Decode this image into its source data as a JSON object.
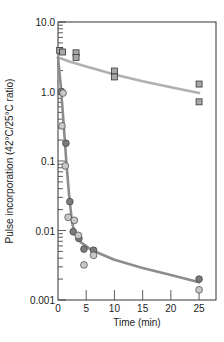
{
  "chart_data": {
    "type": "scatter",
    "title": "",
    "xlabel": "Time (min)",
    "ylabel": "Pulse incorporation (42°C/25°C ratio)",
    "xlim": [
      0,
      28
    ],
    "ylim": [
      0.001,
      10.0
    ],
    "yscale": "log",
    "grid": false,
    "legend": null,
    "x_ticks": [
      0,
      5,
      10,
      15,
      20,
      25
    ],
    "x_tick_labels": [
      "0",
      "5",
      "10",
      "15",
      "20",
      "25"
    ],
    "y_ticks": [
      10.0,
      1.0,
      0.1,
      0.01,
      0.001
    ],
    "y_tick_labels": [
      "10.0",
      "1.0",
      "0.1",
      "0.01",
      "0.001"
    ],
    "series": [
      {
        "name": "squares",
        "marker": "square",
        "color": "#a8a8a8",
        "points": [
          {
            "x": 0.3,
            "y": 3.9
          },
          {
            "x": 0.8,
            "y": 3.7
          },
          {
            "x": 3.2,
            "y": 3.6
          },
          {
            "x": 3.2,
            "y": 3.1
          },
          {
            "x": 10,
            "y": 1.97
          },
          {
            "x": 10,
            "y": 1.62
          },
          {
            "x": 25,
            "y": 1.28
          },
          {
            "x": 25,
            "y": 0.71
          }
        ]
      },
      {
        "name": "dark-circles",
        "marker": "circle",
        "color": "#7a7a7a",
        "points": [
          {
            "x": 0.6,
            "y": 1.0
          },
          {
            "x": 1.4,
            "y": 0.18
          },
          {
            "x": 2.1,
            "y": 0.026
          },
          {
            "x": 2.7,
            "y": 0.0096
          },
          {
            "x": 3.7,
            "y": 0.0077
          },
          {
            "x": 4.6,
            "y": 0.0054
          },
          {
            "x": 6.3,
            "y": 0.0052
          },
          {
            "x": 25,
            "y": 0.002
          }
        ]
      },
      {
        "name": "light-circles",
        "marker": "circle",
        "color": "#c8c8c8",
        "points": [
          {
            "x": 0.9,
            "y": 0.95
          },
          {
            "x": 0.7,
            "y": 0.32
          },
          {
            "x": 1.3,
            "y": 0.085
          },
          {
            "x": 1.8,
            "y": 0.0155
          },
          {
            "x": 2.9,
            "y": 0.014
          },
          {
            "x": 3.6,
            "y": 0.0085
          },
          {
            "x": 6.3,
            "y": 0.0044
          },
          {
            "x": 4.6,
            "y": 0.0032
          },
          {
            "x": 25,
            "y": 0.0014
          }
        ]
      }
    ],
    "fit_curves": [
      {
        "name": "squares-fit",
        "color": "#b0b0b0",
        "points": [
          [
            0,
            3.1
          ],
          [
            2,
            2.7
          ],
          [
            5,
            2.3
          ],
          [
            10,
            1.75
          ],
          [
            15,
            1.4
          ],
          [
            20,
            1.15
          ],
          [
            25,
            0.95
          ]
        ]
      },
      {
        "name": "circles-fit",
        "color": "#8c8c8c",
        "points": [
          [
            0,
            3.1
          ],
          [
            0.5,
            1.2
          ],
          [
            1,
            0.35
          ],
          [
            1.5,
            0.09
          ],
          [
            2,
            0.03
          ],
          [
            2.5,
            0.013
          ],
          [
            3,
            0.009
          ],
          [
            4,
            0.0068
          ],
          [
            6,
            0.0052
          ],
          [
            10,
            0.0038
          ],
          [
            15,
            0.0029
          ],
          [
            20,
            0.0023
          ],
          [
            25,
            0.0018
          ]
        ]
      }
    ]
  }
}
